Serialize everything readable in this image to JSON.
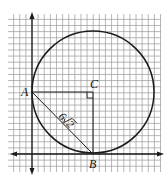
{
  "diagram": {
    "type": "geometry-coordinate-plane",
    "colors": {
      "grid": "#9a9a9a",
      "ink": "#1a1a1a",
      "background": "#ffffff"
    },
    "grid": {
      "x_min": 8,
      "x_max": 161,
      "y_min": 14,
      "y_max": 172,
      "spacing": 6.12
    },
    "axes": {
      "y_axis": {
        "x": 32,
        "y_top": 12,
        "y_bottom": 175
      },
      "x_axis": {
        "y": 154,
        "x_left": 10,
        "x_right": 164
      }
    },
    "circle": {
      "cx": 93,
      "cy": 92,
      "r": 61,
      "center_label": "C"
    },
    "points": {
      "A": {
        "label": "A",
        "x": 32,
        "y": 92
      },
      "B": {
        "label": "B",
        "x": 93,
        "y": 154
      },
      "C": {
        "label": "C",
        "x": 93,
        "y": 92
      }
    },
    "segments": [
      {
        "from": "A",
        "to": "C"
      },
      {
        "from": "C",
        "to": "B"
      },
      {
        "from": "A",
        "to": "B",
        "label": "6√2"
      }
    ],
    "right_angle_at": "C",
    "chord_label": {
      "coefficient": "6",
      "radicand": "2"
    }
  }
}
